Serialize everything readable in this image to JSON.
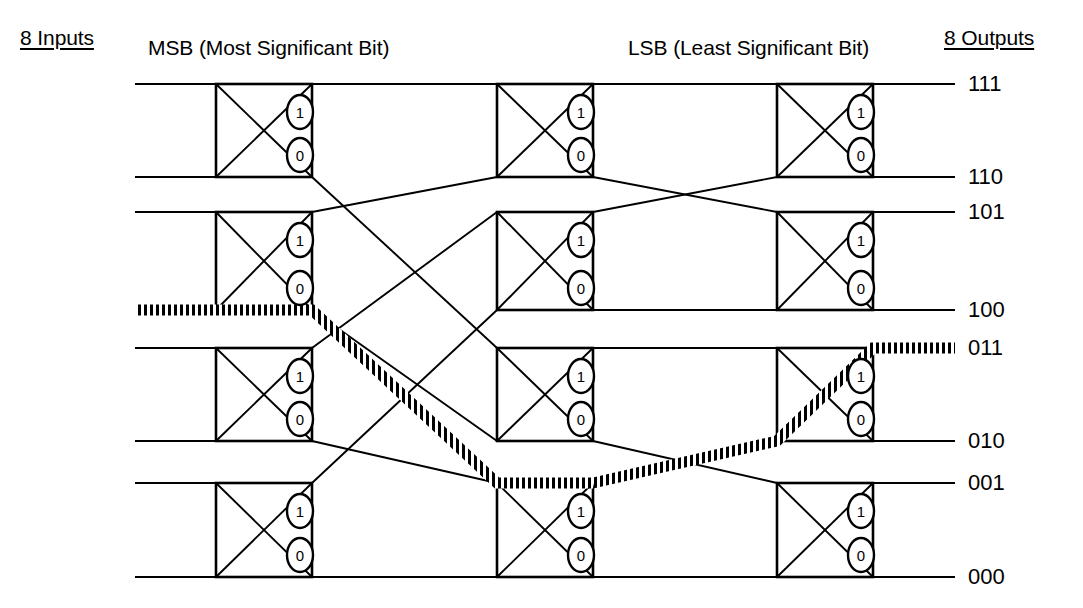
{
  "diagram": {
    "type": "switching-network",
    "inputs_label": "8 Inputs",
    "outputs_label": "8 Outputs",
    "stage_labels": {
      "first": "MSB (Most Significant Bit)",
      "last": "LSB (Least Significant Bit)"
    },
    "output_labels": [
      "111",
      "110",
      "101",
      "100",
      "011",
      "010",
      "001",
      "000"
    ],
    "switch_port_labels": {
      "upper": "1",
      "lower": "0"
    },
    "colors": {
      "line": "#000000",
      "background": "#ffffff",
      "highlight": "#000000"
    },
    "stage_count": 3,
    "switches_per_stage": 4,
    "highlight_route": {
      "description": "Routed path from input line 100 through the network to output 011",
      "input_line": "100",
      "output_line": "011",
      "decisions": [
        "0",
        "1",
        "1"
      ]
    }
  },
  "geometry": {
    "row_y": [
      84,
      177,
      212,
      310,
      348,
      441,
      483,
      577
    ],
    "box_cols": [
      {
        "x": 216,
        "w": 96
      },
      {
        "x": 497,
        "w": 96
      },
      {
        "x": 777,
        "w": 96
      }
    ],
    "left_edge": 135,
    "right_edge": 955,
    "box_rows": [
      {
        "top": 84,
        "bottom": 177
      },
      {
        "top": 212,
        "bottom": 310
      },
      {
        "top": 348,
        "bottom": 441
      },
      {
        "top": 483,
        "bottom": 577
      }
    ],
    "out_label_y": [
      84,
      177,
      212,
      310,
      348,
      441,
      483,
      577
    ]
  },
  "chart_data": {
    "type": "diagram",
    "nodes": [
      {
        "id": "s1-0",
        "stage": 1,
        "row": 0,
        "upper_port": "1",
        "lower_port": "0"
      },
      {
        "id": "s1-1",
        "stage": 1,
        "row": 1,
        "upper_port": "1",
        "lower_port": "0"
      },
      {
        "id": "s1-2",
        "stage": 1,
        "row": 2,
        "upper_port": "1",
        "lower_port": "0"
      },
      {
        "id": "s1-3",
        "stage": 1,
        "row": 3,
        "upper_port": "1",
        "lower_port": "0"
      },
      {
        "id": "s2-0",
        "stage": 2,
        "row": 0,
        "upper_port": "1",
        "lower_port": "0"
      },
      {
        "id": "s2-1",
        "stage": 2,
        "row": 1,
        "upper_port": "1",
        "lower_port": "0"
      },
      {
        "id": "s2-2",
        "stage": 2,
        "row": 2,
        "upper_port": "1",
        "lower_port": "0"
      },
      {
        "id": "s2-3",
        "stage": 2,
        "row": 3,
        "upper_port": "1",
        "lower_port": "0"
      },
      {
        "id": "s3-0",
        "stage": 3,
        "row": 0,
        "upper_port": "1",
        "lower_port": "0"
      },
      {
        "id": "s3-1",
        "stage": 3,
        "row": 1,
        "upper_port": "1",
        "lower_port": "0"
      },
      {
        "id": "s3-2",
        "stage": 3,
        "row": 2,
        "upper_port": "1",
        "lower_port": "0"
      },
      {
        "id": "s3-3",
        "stage": 3,
        "row": 3,
        "upper_port": "1",
        "lower_port": "0"
      }
    ],
    "links_stage1_to_stage2": [
      {
        "from": "s1-0.1",
        "to": "s2-0.top"
      },
      {
        "from": "s1-0.0",
        "to": "s2-2.top"
      },
      {
        "from": "s1-1.1",
        "to": "s2-0.bottom"
      },
      {
        "from": "s1-1.0",
        "to": "s2-2.bottom"
      },
      {
        "from": "s1-2.1",
        "to": "s2-1.top"
      },
      {
        "from": "s1-2.0",
        "to": "s2-3.top"
      },
      {
        "from": "s1-3.1",
        "to": "s2-1.bottom"
      },
      {
        "from": "s1-3.0",
        "to": "s2-3.bottom"
      }
    ],
    "links_stage2_to_stage3": [
      {
        "from": "s2-0.1",
        "to": "s3-0.top"
      },
      {
        "from": "s2-0.0",
        "to": "s3-1.top"
      },
      {
        "from": "s2-1.1",
        "to": "s3-0.bottom"
      },
      {
        "from": "s2-1.0",
        "to": "s3-1.bottom"
      },
      {
        "from": "s2-2.1",
        "to": "s3-2.top"
      },
      {
        "from": "s2-2.0",
        "to": "s3-3.top"
      },
      {
        "from": "s2-3.1",
        "to": "s3-2.bottom"
      },
      {
        "from": "s2-3.0",
        "to": "s3-3.bottom"
      }
    ]
  }
}
